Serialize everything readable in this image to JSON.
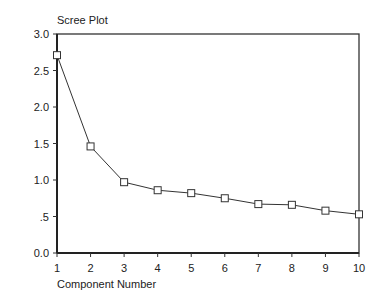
{
  "chart_data": {
    "type": "line",
    "title": "Scree Plot",
    "xlabel": "Component Number",
    "ylabel": "Eigenvalue",
    "x": [
      1,
      2,
      3,
      4,
      5,
      6,
      7,
      8,
      9,
      10
    ],
    "series": [
      {
        "name": "Eigenvalue",
        "values": [
          2.71,
          1.46,
          0.97,
          0.86,
          0.82,
          0.75,
          0.67,
          0.66,
          0.58,
          0.53
        ],
        "marker": "square"
      }
    ],
    "xlim": [
      1,
      10
    ],
    "ylim": [
      0,
      3.0
    ],
    "yticks": [
      "0.0",
      ".5",
      "1.0",
      "1.5",
      "2.0",
      "2.5",
      "3.0"
    ],
    "ytick_values": [
      0,
      0.5,
      1.0,
      1.5,
      2.0,
      2.5,
      3.0
    ],
    "xticks": [
      "1",
      "2",
      "3",
      "4",
      "5",
      "6",
      "7",
      "8",
      "9",
      "10"
    ],
    "grid": false,
    "legend": null
  }
}
